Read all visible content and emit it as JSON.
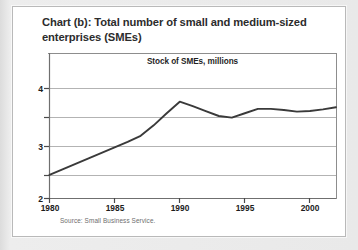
{
  "figure": {
    "title": "Chart (b): Total number of small and medium-sized enterprises (SMEs)",
    "plot_header": "Stock of SMEs, millions",
    "source": "Source: Small Business Service.",
    "panel_background": "#ffffff",
    "page_background": "#e7e7e7",
    "line_color": "#3a3a3a",
    "grid_color": "#b3b3b3",
    "axis_color": "#8d8d8d",
    "text_color": "#2c2c2c"
  },
  "chart_data": {
    "type": "line",
    "title": "Chart (b): Total number of small and medium-sized enterprises (SMEs)",
    "subtitle": "Stock of SMEs, millions",
    "xlabel": "",
    "ylabel": "millions",
    "source": "Source: Small Business Service.",
    "grid": true,
    "legend": false,
    "xlim": [
      1980,
      2002
    ],
    "ylim": [
      2,
      4.25
    ],
    "xticks": [
      1980,
      1985,
      1990,
      1995,
      2000
    ],
    "xticklabels": [
      "1980",
      "1985",
      "1990",
      "1995",
      "2000"
    ],
    "yticks": [
      2,
      2.5,
      3,
      3.5,
      4
    ],
    "yticklabels": [
      "2",
      "",
      "3",
      "",
      "4"
    ],
    "series": [
      {
        "name": "Stock of SMEs, millions",
        "x": [
          1980,
          1981,
          1982,
          1983,
          1984,
          1985,
          1986,
          1987,
          1988,
          1989,
          1990,
          1991,
          1992,
          1993,
          1994,
          1995,
          1996,
          1997,
          1998,
          1999,
          2000,
          2001,
          2002
        ],
        "values": [
          2.43,
          2.53,
          2.63,
          2.73,
          2.83,
          2.93,
          3.03,
          3.14,
          3.33,
          3.55,
          3.76,
          3.68,
          3.59,
          3.5,
          3.47,
          3.55,
          3.63,
          3.63,
          3.61,
          3.58,
          3.59,
          3.62,
          3.66
        ]
      }
    ]
  }
}
